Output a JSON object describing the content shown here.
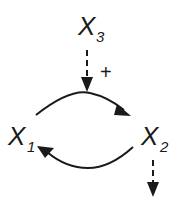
{
  "diagram": {
    "type": "causal-loop",
    "nodes": [
      {
        "id": "x3",
        "label": "X",
        "subscript": "3"
      },
      {
        "id": "x1",
        "label": "X",
        "subscript": "1"
      },
      {
        "id": "x2",
        "label": "X",
        "subscript": "2"
      }
    ],
    "edges": [
      {
        "from": "x3",
        "to": "x1-x2-edge",
        "style": "dashed",
        "sign": "+"
      },
      {
        "from": "x1",
        "to": "x2",
        "style": "solid",
        "curve": "upper"
      },
      {
        "from": "x2",
        "to": "x1",
        "style": "solid",
        "curve": "lower"
      },
      {
        "from": "x2",
        "to": "output",
        "style": "dashed"
      }
    ],
    "signs": {
      "x3_edge": "+"
    },
    "colors": {
      "stroke": "#1a1a1a",
      "background": "#ffffff"
    }
  }
}
